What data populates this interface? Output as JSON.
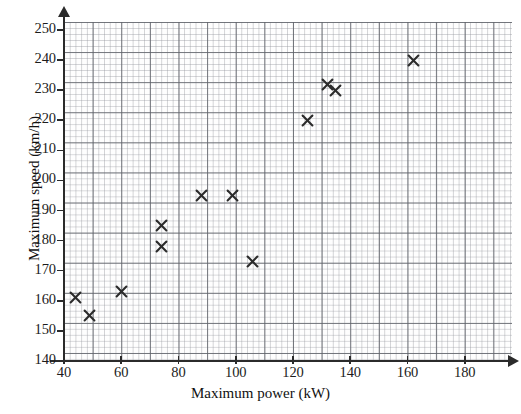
{
  "chart_data": {
    "type": "scatter",
    "title": "",
    "xlabel": "Maximum power (kW)",
    "ylabel": "Maximum speed (km/h)",
    "xlim": [
      40,
      190
    ],
    "ylim": [
      140,
      252
    ],
    "grid": true,
    "legend_position": "none",
    "marker": "x",
    "marker_color": "#2b2b2b",
    "x_ticks": [
      40,
      60,
      80,
      100,
      120,
      140,
      160,
      180
    ],
    "y_ticks": [
      140,
      150,
      160,
      170,
      180,
      190,
      200,
      210,
      220,
      230,
      240,
      250
    ],
    "x_minor_step": 2,
    "y_minor_step": 2,
    "points": [
      {
        "x": 44,
        "y": 161
      },
      {
        "x": 49,
        "y": 155
      },
      {
        "x": 60,
        "y": 163
      },
      {
        "x": 74,
        "y": 185
      },
      {
        "x": 74,
        "y": 178
      },
      {
        "x": 88,
        "y": 195
      },
      {
        "x": 99,
        "y": 195
      },
      {
        "x": 106,
        "y": 173
      },
      {
        "x": 125,
        "y": 220
      },
      {
        "x": 132,
        "y": 232
      },
      {
        "x": 135,
        "y": 230
      },
      {
        "x": 162,
        "y": 240
      }
    ]
  },
  "axes": {
    "x_title": "Maximum power (kW)",
    "y_title": "Maximum speed (km/h)"
  }
}
